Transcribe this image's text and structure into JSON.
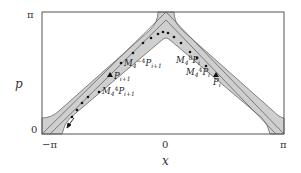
{
  "figure": {
    "xlabel": "x",
    "ylabel": "p",
    "x_ticks": [
      "−π",
      "0",
      "π"
    ],
    "y_ticks": [
      "π",
      "0"
    ],
    "annotations": [
      {
        "id": "minv-pi1",
        "base": "M",
        "sub": "4",
        "sup": "−4",
        "tail": "P",
        "tail_sub": "i+1",
        "marker": "dot"
      },
      {
        "id": "pi1",
        "base": "P",
        "sub": "i+1",
        "sup": "",
        "tail": "",
        "tail_sub": "",
        "marker": "triangle"
      },
      {
        "id": "m4-pi1",
        "base": "M",
        "sub": "4",
        "sup": "4",
        "tail": "P",
        "tail_sub": "i+1",
        "marker": "dot"
      },
      {
        "id": "m8-pi",
        "base": "M",
        "sub": "4",
        "sup": "8",
        "tail": "P",
        "tail_sub": "i",
        "marker": "dot"
      },
      {
        "id": "m4-pi",
        "base": "M",
        "sub": "4",
        "sup": "4",
        "tail": "P",
        "tail_sub": "i",
        "marker": "dot"
      },
      {
        "id": "pi",
        "base": "P",
        "sub": "i",
        "sup": "",
        "tail": "",
        "tail_sub": "",
        "marker": "triangle"
      }
    ],
    "colors": {
      "frame": "#555555",
      "band_fill": "#cccccc",
      "band_edge": "#555555",
      "dots": "#111111"
    }
  }
}
